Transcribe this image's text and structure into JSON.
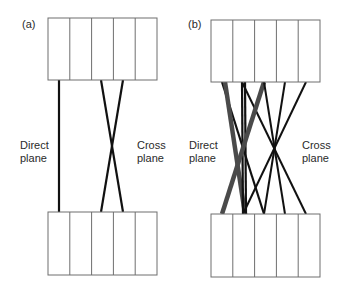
{
  "panels": [
    {
      "id": "a",
      "label": "(a)",
      "left_label": [
        "Direct",
        "plane"
      ],
      "right_label": [
        "Cross",
        "plane"
      ],
      "top_box": {
        "x": 48,
        "y": 18,
        "w": 109,
        "h": 62,
        "cols": 5
      },
      "bottom_box": {
        "x": 48,
        "y": 212,
        "w": 109,
        "h": 63,
        "cols": 5
      },
      "lines": [
        {
          "x1": 59,
          "y1": 80,
          "x2": 59,
          "y2": 212,
          "color": "#111111",
          "width": 2.2
        },
        {
          "x1": 101,
          "y1": 80,
          "x2": 123,
          "y2": 212,
          "color": "#111111",
          "width": 2.2
        },
        {
          "x1": 123,
          "y1": 80,
          "x2": 101,
          "y2": 212,
          "color": "#111111",
          "width": 2.2
        }
      ]
    },
    {
      "id": "b",
      "label": "(b)",
      "left_label": [
        "Direct",
        "plane"
      ],
      "right_label": [
        "Cross",
        "plane"
      ],
      "top_box": {
        "x": 211,
        "y": 20,
        "w": 109,
        "h": 62,
        "cols": 5
      },
      "bottom_box": {
        "x": 211,
        "y": 214,
        "w": 109,
        "h": 63,
        "cols": 5
      },
      "lines": [
        {
          "x1": 222,
          "y1": 82,
          "x2": 264,
          "y2": 214,
          "color": "#111111",
          "width": 2.2
        },
        {
          "x1": 225,
          "y1": 82,
          "x2": 245,
          "y2": 214,
          "color": "#4a4a4a",
          "width": 4.5
        },
        {
          "x1": 242,
          "y1": 82,
          "x2": 243,
          "y2": 214,
          "color": "#111111",
          "width": 2.2
        },
        {
          "x1": 245,
          "y1": 82,
          "x2": 246,
          "y2": 214,
          "color": "#111111",
          "width": 2.2
        },
        {
          "x1": 242,
          "y1": 82,
          "x2": 306,
          "y2": 214,
          "color": "#111111",
          "width": 2.0
        },
        {
          "x1": 264,
          "y1": 82,
          "x2": 222,
          "y2": 214,
          "color": "#4a4a4a",
          "width": 4.5
        },
        {
          "x1": 285,
          "y1": 82,
          "x2": 264,
          "y2": 214,
          "color": "#111111",
          "width": 2.0
        },
        {
          "x1": 306,
          "y1": 82,
          "x2": 243,
          "y2": 214,
          "color": "#111111",
          "width": 2.0
        },
        {
          "x1": 264,
          "y1": 82,
          "x2": 285,
          "y2": 214,
          "color": "#111111",
          "width": 2.0
        }
      ]
    }
  ],
  "colors": {
    "box_stroke": "#6e6e6e",
    "line_black": "#111111",
    "line_gray": "#4a4a4a",
    "text": "#2a2a2a"
  }
}
